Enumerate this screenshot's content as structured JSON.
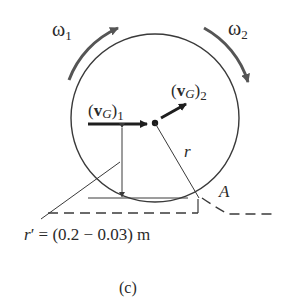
{
  "diagram": {
    "labels": {
      "omega1": "ω",
      "omega1_sub": "1",
      "omega2": "ω",
      "omega2_sub": "2",
      "vG1_open": "(",
      "vG1_v": "v",
      "vG1_G": "G",
      "vG1_close": ")",
      "vG1_sub": "1",
      "vG2_open": "(",
      "vG2_v": "v",
      "vG2_G": "G",
      "vG2_close": ")",
      "vG2_sub": "2",
      "radius": "r",
      "point_A": "A",
      "r_prime_r": "r",
      "r_prime_rest": "′ = (0.2 − 0.03) m",
      "caption": "(c)"
    },
    "elements": {
      "wheel": "circle",
      "center": "G",
      "contact_point": "A",
      "ground": "dashed line with corner",
      "dimension": "vertical arrow from center height to A-level line"
    },
    "colors": {
      "stroke": "#3a3a3a",
      "arrow": "#1e1e1e",
      "rotation_arrow": "#555555",
      "background": "#ffffff"
    }
  }
}
